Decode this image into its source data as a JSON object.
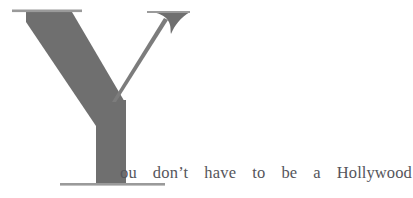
{
  "page": {
    "background_color": "#ffffff",
    "width": 413,
    "height": 198
  },
  "dropcap": {
    "letter": "Y",
    "icon_name": "dropcap-letter-y",
    "fill_color": "#6f6f6f",
    "hairline_color": "#8a8a8a",
    "serif_color": "#9a9a9a"
  },
  "body": {
    "text": "ou don't have to be a Hollywood",
    "text_color": "#55555b",
    "alignment": "justified",
    "words": [
      {
        "text": "ou"
      },
      {
        "text": "don’t"
      },
      {
        "text": "have"
      },
      {
        "text": "to"
      },
      {
        "text": "be"
      },
      {
        "text": "a"
      },
      {
        "text": "Hollywood"
      }
    ]
  }
}
